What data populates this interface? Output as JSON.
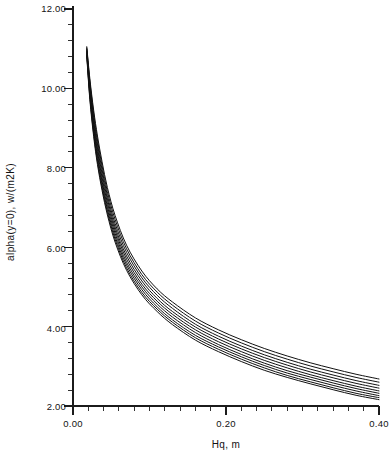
{
  "chart_data": {
    "type": "line",
    "title": "",
    "xlabel": "Hq,  m",
    "ylabel": "alpha(y=0),  w/(m2K)",
    "xlim": [
      0.0,
      0.4
    ],
    "ylim": [
      2.0,
      12.0
    ],
    "xticks": [
      0.0,
      0.2,
      0.4
    ],
    "xticklabels": [
      "0.00",
      "0.20",
      "0.40"
    ],
    "yticks": [
      2.0,
      4.0,
      6.0,
      8.0,
      10.0,
      12.0
    ],
    "yticklabels": [
      "2.00",
      "4.00",
      "6.00",
      "8.00",
      "10.00",
      "12.00"
    ],
    "x_minor_per_major": 10,
    "y_minor_per_major": 5,
    "grid": false,
    "legend": "none",
    "series_count": 9,
    "series": [
      {
        "name": "curve-1",
        "x": [
          0.018,
          0.022,
          0.027,
          0.032,
          0.038,
          0.045,
          0.055,
          0.07,
          0.09,
          0.11,
          0.13,
          0.16,
          0.19,
          0.22,
          0.25,
          0.28,
          0.31,
          0.34,
          0.37,
          0.4
        ],
        "y": [
          11.05,
          10.25,
          9.45,
          8.8,
          8.15,
          7.5,
          6.8,
          6.05,
          5.4,
          4.95,
          4.62,
          4.22,
          3.92,
          3.67,
          3.45,
          3.26,
          3.09,
          2.94,
          2.8,
          2.68
        ]
      },
      {
        "name": "curve-2",
        "x": [
          0.018,
          0.022,
          0.027,
          0.032,
          0.038,
          0.045,
          0.055,
          0.07,
          0.09,
          0.11,
          0.13,
          0.16,
          0.19,
          0.22,
          0.25,
          0.28,
          0.31,
          0.34,
          0.37,
          0.4
        ],
        "y": [
          11.02,
          10.18,
          9.36,
          8.7,
          8.05,
          7.4,
          6.7,
          5.96,
          5.31,
          4.87,
          4.54,
          4.14,
          3.84,
          3.59,
          3.37,
          3.18,
          3.01,
          2.86,
          2.72,
          2.6
        ]
      },
      {
        "name": "curve-3",
        "x": [
          0.018,
          0.022,
          0.027,
          0.032,
          0.038,
          0.045,
          0.055,
          0.07,
          0.09,
          0.11,
          0.13,
          0.16,
          0.19,
          0.22,
          0.25,
          0.28,
          0.31,
          0.34,
          0.37,
          0.4
        ],
        "y": [
          10.99,
          10.11,
          9.27,
          8.6,
          7.95,
          7.3,
          6.6,
          5.87,
          5.23,
          4.79,
          4.46,
          4.06,
          3.76,
          3.51,
          3.29,
          3.1,
          2.93,
          2.78,
          2.64,
          2.52
        ]
      },
      {
        "name": "curve-4",
        "x": [
          0.018,
          0.022,
          0.027,
          0.032,
          0.038,
          0.045,
          0.055,
          0.07,
          0.09,
          0.11,
          0.13,
          0.16,
          0.19,
          0.22,
          0.25,
          0.28,
          0.31,
          0.34,
          0.37,
          0.4
        ],
        "y": [
          10.96,
          10.04,
          9.18,
          8.5,
          7.85,
          7.21,
          6.51,
          5.78,
          5.15,
          4.71,
          4.38,
          3.99,
          3.69,
          3.44,
          3.22,
          3.03,
          2.86,
          2.71,
          2.57,
          2.45
        ]
      },
      {
        "name": "curve-5",
        "x": [
          0.018,
          0.022,
          0.027,
          0.032,
          0.038,
          0.045,
          0.055,
          0.07,
          0.09,
          0.11,
          0.13,
          0.16,
          0.19,
          0.22,
          0.25,
          0.28,
          0.31,
          0.34,
          0.37,
          0.4
        ],
        "y": [
          10.93,
          9.97,
          9.09,
          8.41,
          7.75,
          7.12,
          6.43,
          5.7,
          5.07,
          4.64,
          4.31,
          3.92,
          3.62,
          3.37,
          3.15,
          2.96,
          2.79,
          2.64,
          2.5,
          2.38
        ]
      },
      {
        "name": "curve-6",
        "x": [
          0.018,
          0.022,
          0.027,
          0.032,
          0.038,
          0.045,
          0.055,
          0.07,
          0.09,
          0.11,
          0.13,
          0.16,
          0.19,
          0.22,
          0.25,
          0.28,
          0.31,
          0.34,
          0.37,
          0.4
        ],
        "y": [
          10.9,
          9.9,
          9.01,
          8.32,
          7.66,
          7.03,
          6.35,
          5.62,
          5.0,
          4.57,
          4.24,
          3.85,
          3.55,
          3.3,
          3.08,
          2.89,
          2.73,
          2.58,
          2.44,
          2.32
        ]
      },
      {
        "name": "curve-7",
        "x": [
          0.018,
          0.022,
          0.027,
          0.032,
          0.038,
          0.045,
          0.055,
          0.07,
          0.09,
          0.11,
          0.13,
          0.16,
          0.19,
          0.22,
          0.25,
          0.28,
          0.31,
          0.34,
          0.37,
          0.4
        ],
        "y": [
          10.87,
          9.84,
          8.93,
          8.23,
          7.58,
          6.95,
          6.27,
          5.55,
          4.93,
          4.5,
          4.17,
          3.78,
          3.49,
          3.24,
          3.02,
          2.83,
          2.67,
          2.52,
          2.38,
          2.26
        ]
      },
      {
        "name": "curve-8",
        "x": [
          0.018,
          0.022,
          0.027,
          0.032,
          0.038,
          0.045,
          0.055,
          0.07,
          0.09,
          0.11,
          0.13,
          0.16,
          0.19,
          0.22,
          0.25,
          0.28,
          0.31,
          0.34,
          0.37,
          0.4
        ],
        "y": [
          10.84,
          9.78,
          8.86,
          8.15,
          7.5,
          6.88,
          6.2,
          5.48,
          4.86,
          4.44,
          4.11,
          3.72,
          3.43,
          3.18,
          2.96,
          2.77,
          2.61,
          2.46,
          2.32,
          2.21
        ]
      },
      {
        "name": "curve-9",
        "x": [
          0.018,
          0.022,
          0.027,
          0.032,
          0.038,
          0.045,
          0.055,
          0.07,
          0.09,
          0.11,
          0.13,
          0.16,
          0.19,
          0.22,
          0.25,
          0.28,
          0.31,
          0.34,
          0.37,
          0.4
        ],
        "y": [
          10.81,
          9.72,
          8.79,
          8.08,
          7.43,
          6.81,
          6.13,
          5.42,
          4.8,
          4.38,
          4.05,
          3.66,
          3.37,
          3.12,
          2.9,
          2.72,
          2.56,
          2.41,
          2.27,
          2.16
        ]
      }
    ]
  },
  "axes": {
    "x_title": "Hq,  m",
    "y_title": "alpha(y=0),  w/(m2K)",
    "x_tick_labels": [
      "0.00",
      "0.20",
      "0.40"
    ],
    "y_tick_labels": [
      "12.00",
      "10.00",
      "8.00",
      "6.00",
      "4.00",
      "2.00"
    ]
  },
  "colors": {
    "curve": "#111111",
    "axis": "#1b1b1b",
    "background": "#ffffff",
    "text": "#121212"
  }
}
